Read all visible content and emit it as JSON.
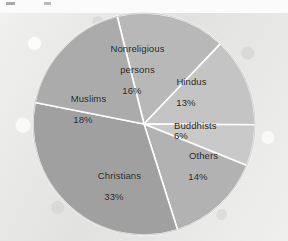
{
  "figure": {
    "background_color": "#e9e9e7",
    "divider_color": "#ffffff",
    "text_color": "#1d1d1d"
  },
  "chart_data": {
    "type": "pie",
    "title": "",
    "subtitle": "",
    "xlabel": "",
    "ylabel": "",
    "legend_position": "none",
    "grid": false,
    "labels_on_slices": true,
    "total_percent": 100,
    "start_angle_deg": -14,
    "direction": "clockwise",
    "categories": [
      "Nonreligious persons",
      "Hindus",
      "Buddhists",
      "Others",
      "Christians",
      "Muslims"
    ],
    "values": [
      16,
      13,
      6,
      14,
      33,
      18
    ],
    "slices": [
      {
        "name": "Nonreligious persons",
        "label_line1": "Nonreligious",
        "label_line2": "persons",
        "value": 16,
        "value_label": "16%",
        "color": "#b8b8b8"
      },
      {
        "name": "Hindus",
        "label_line1": "Hindus",
        "label_line2": "",
        "value": 13,
        "value_label": "13%",
        "color": "#c4c4c4"
      },
      {
        "name": "Buddhists",
        "label_line1": "Buddhists",
        "label_line2": "",
        "value": 6,
        "value_label": "6%",
        "color": "#c9c9c9"
      },
      {
        "name": "Others",
        "label_line1": "Others",
        "label_line2": "",
        "value": 14,
        "value_label": "14%",
        "color": "#b2b2b2"
      },
      {
        "name": "Christians",
        "label_line1": "Christians",
        "label_line2": "",
        "value": 33,
        "value_label": "33%",
        "color": "#a0a0a0"
      },
      {
        "name": "Muslims",
        "label_line1": "Muslims",
        "label_line2": "",
        "value": 18,
        "value_label": "18%",
        "color": "#ababab"
      }
    ]
  }
}
